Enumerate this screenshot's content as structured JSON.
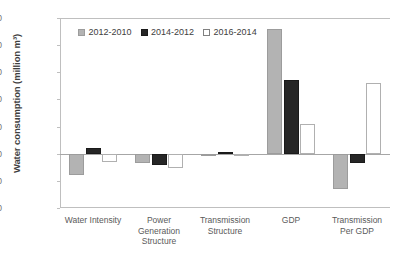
{
  "chart_data": {
    "type": "bar",
    "title": "",
    "xlabel": "",
    "ylabel": "Water consumption (million m³)",
    "ylim": [
      -1000,
      2500
    ],
    "yticks": [
      2500,
      2000,
      1500,
      1000,
      500,
      0,
      -500,
      -1000
    ],
    "ytick_labels": [
      "2500",
      "2000",
      "1500",
      "1000",
      "500",
      "0",
      "-500",
      "-1000"
    ],
    "grid": false,
    "legend_position": "top-left",
    "categories": [
      "Water Intensity",
      "Power\nGeneration\nStructure",
      "Transmission\nStructure",
      "GDP",
      "Transmission\nPer GDP"
    ],
    "series": [
      {
        "name": "2012-2010",
        "color": "#b3b3b3",
        "values": [
          -400,
          -180,
          -15,
          2300,
          -650
        ]
      },
      {
        "name": "2014-2012",
        "color": "#262626",
        "values": [
          110,
          -200,
          25,
          1350,
          -180
        ]
      },
      {
        "name": "2016-2014",
        "color": "#ffffff",
        "values": [
          -160,
          -270,
          -5,
          550,
          1300
        ]
      }
    ]
  }
}
